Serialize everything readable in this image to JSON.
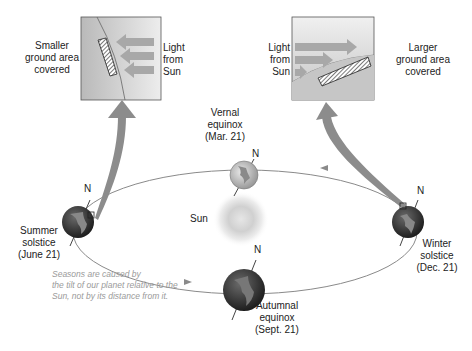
{
  "diagram": {
    "topic": "Earth's seasons and orbit",
    "left_inset": {
      "left_label": [
        "Smaller",
        "ground area",
        "covered"
      ],
      "right_label": [
        "Light",
        "from",
        "Sun"
      ]
    },
    "right_inset": {
      "left_label": [
        "Light",
        "from",
        "Sun"
      ],
      "right_label": [
        "Larger",
        "ground area",
        "covered"
      ]
    },
    "sun_label": "Sun",
    "north_label": "N",
    "positions": [
      {
        "id": "vernal",
        "lines": [
          "Vernal",
          "equinox",
          "(Mar. 21)"
        ]
      },
      {
        "id": "summer",
        "lines": [
          "Summer",
          "solstice",
          "(June 21)"
        ]
      },
      {
        "id": "autumnal",
        "lines": [
          "Autumnal",
          "equinox",
          "(Sept. 21)"
        ]
      },
      {
        "id": "winter",
        "lines": [
          "Winter",
          "solstice",
          "(Dec. 21)"
        ]
      }
    ],
    "caption": [
      "Seasons are caused by",
      "the tilt of our planet relative to the",
      "Sun, not by its distance from it."
    ]
  },
  "colors": {
    "orbit": "#8a8a8a",
    "arrow": "#8c8c8c",
    "inset_bg": "#d8d8d8",
    "earth_dark": "#3a3a3a",
    "caption": "#9a9a9a"
  }
}
